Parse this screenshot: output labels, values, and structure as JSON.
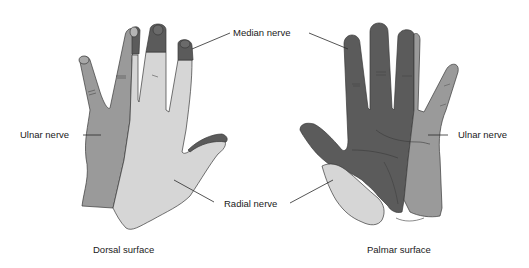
{
  "figure": {
    "colors": {
      "median": "#5b5b5b",
      "ulnar": "#9a9a9a",
      "radial": "#d6d6d6",
      "outline": "#3a3a3a",
      "background": "#ffffff"
    },
    "panels": [
      {
        "caption": "Dorsal surface",
        "labels": {
          "ulnar": "Ulnar nerve",
          "radial": "Radial nerve"
        }
      },
      {
        "caption": "Palmar surface",
        "labels": {
          "ulnar": "Ulnar nerve"
        }
      }
    ],
    "shared_labels": {
      "median": "Median nerve",
      "radial": "Radial nerve"
    }
  }
}
